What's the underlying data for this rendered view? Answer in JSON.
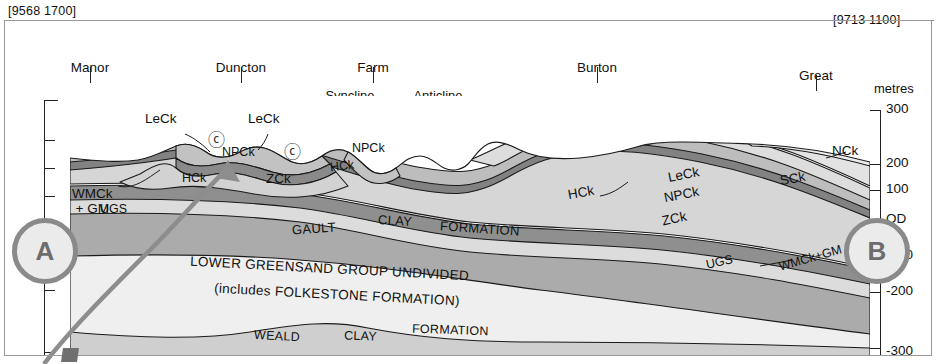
{
  "figure": {
    "type": "geological-cross-section",
    "left_grid_ref": "[9568 1700]",
    "right_grid_ref": "[9713 1100]",
    "axis_title": "metres",
    "left_end_label": "A",
    "right_end_label": "B"
  },
  "places": [
    {
      "line1": "Manor",
      "line2": "Farm"
    },
    {
      "line1": "Duncton",
      "line2": "Down"
    },
    {
      "line1": "Farm",
      "line2": "Hill"
    },
    {
      "line1": "Burton",
      "line2": "Down"
    },
    {
      "line1": "Great",
      "line2": "Down"
    }
  ],
  "fold_symbols": [
    {
      "label": "Syncline",
      "icon": "syncline-icon"
    },
    {
      "label": "Anticline",
      "icon": "anticline-icon"
    }
  ],
  "axis": {
    "labels": [
      "300",
      "200",
      "100",
      "OD",
      "-100",
      "-200",
      "-300"
    ],
    "unit": "metres"
  },
  "unit_labels": [
    {
      "id": "leck-left-1",
      "text": "LeCk"
    },
    {
      "id": "leck-left-2",
      "text": "LeCk"
    },
    {
      "id": "wmck-gm-left",
      "text": "WMCk\n+ GM"
    },
    {
      "id": "npck-left",
      "text": "NPCk"
    },
    {
      "id": "hck-left",
      "text": "HCk"
    },
    {
      "id": "zck-left",
      "text": "ZCk"
    },
    {
      "id": "npck-mid",
      "text": "NPCk"
    },
    {
      "id": "hck-mid",
      "text": "HCk"
    },
    {
      "id": "ugs-left",
      "text": "UGS"
    },
    {
      "id": "nck-right",
      "text": "NCk"
    },
    {
      "id": "sck-right",
      "text": "SCk"
    },
    {
      "id": "leck-right",
      "text": "LeCk"
    },
    {
      "id": "npck-right",
      "text": "NPCk"
    },
    {
      "id": "hck-right",
      "text": "HCk"
    },
    {
      "id": "zck-right",
      "text": "ZCk"
    },
    {
      "id": "ugs-right",
      "text": "UGS"
    },
    {
      "id": "wmck-gm-right",
      "text": "WMCk+GM"
    }
  ],
  "formation_labels": [
    {
      "id": "gault",
      "text": "GAULT"
    },
    {
      "id": "gault-clay",
      "text": "CLAY"
    },
    {
      "id": "gault-fm",
      "text": "FORMATION"
    },
    {
      "id": "lgs-1",
      "text": "LOWER GREENSAND GROUP UNDIVIDED"
    },
    {
      "id": "lgs-2",
      "text": "(includes FOLKESTONE FORMATION)"
    },
    {
      "id": "weald",
      "text": "WEALD"
    },
    {
      "id": "weald-clay",
      "text": "CLAY"
    },
    {
      "id": "weald-fm",
      "text": "FORMATION"
    }
  ],
  "map_symbols": [
    {
      "id": "clay-with-flints-1",
      "glyph": "ⓒ"
    },
    {
      "id": "clay-with-flints-2",
      "glyph": "ⓒ"
    }
  ],
  "colors": {
    "ink": "#111111",
    "frame": "#9a9a9a",
    "marker_ring": "#8a8a8a",
    "marker_fill": "#ebebeb",
    "marker_text": "#6d6d6d",
    "arrow": "#8d8d8d",
    "chalk_light": "#d9d9d9",
    "chalk_mid": "#bdbdbd",
    "chalk_dark": "#9a9a9a",
    "band_dark": "#878787",
    "gault": "#a9a9a9",
    "lgs": "#ededed",
    "weald": "#cfcfcf",
    "sky": "#ffffff"
  }
}
